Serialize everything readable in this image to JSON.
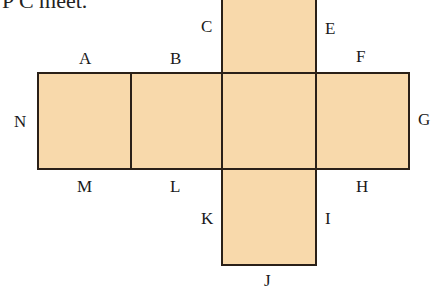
{
  "caption": "P C meet.",
  "diagram": {
    "type": "cube-net",
    "fill_color": "#f8d9ab",
    "stroke_color": "#2a2018",
    "labels": {
      "A": "A",
      "B": "B",
      "C": "C",
      "E": "E",
      "F": "F",
      "G": "G",
      "H": "H",
      "I": "I",
      "J": "J",
      "K": "K",
      "L": "L",
      "M": "M",
      "N": "N"
    }
  }
}
